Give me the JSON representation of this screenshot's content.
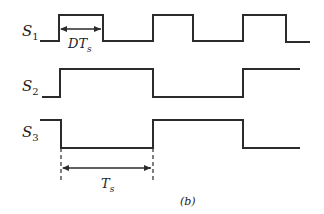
{
  "diagram": {
    "type": "timing-diagram",
    "caption": "(b)",
    "signals": [
      {
        "name": "S",
        "sub": "1",
        "label": "S1"
      },
      {
        "name": "S",
        "sub": "2",
        "label": "S2"
      },
      {
        "name": "S",
        "sub": "3",
        "label": "S3"
      }
    ],
    "annotations": {
      "duty": {
        "main": "DT",
        "sub": "s",
        "label": "DTs"
      },
      "period": {
        "main": "T",
        "sub": "s",
        "label": "Ts"
      }
    },
    "colors": {
      "line": "#2b2b2b",
      "background": "#ffffff"
    }
  }
}
